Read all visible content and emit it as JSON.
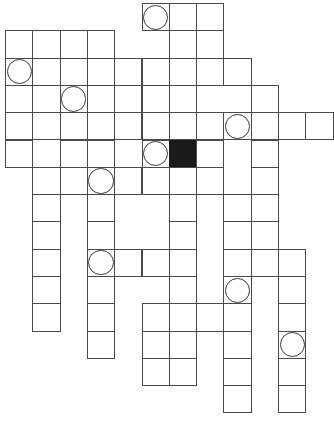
{
  "puzzle": {
    "title": "Crossword Grid",
    "type": "crossword-blank-grid",
    "columns": 12,
    "rows": 16,
    "cell_size": 27.3,
    "origin_x": 5,
    "origin_y": 3,
    "colors": {
      "background": "#ffffff",
      "cell_fill": "#ffffff",
      "cell_border": "#4a4a4a",
      "blocked_cell": "#1a1a1a",
      "circle_stroke": "#3c3c3c"
    },
    "legend": {
      "open_cell": "white square with thin grey border",
      "blocked_cell": "solid black square",
      "circled_cell": "white square containing an inscribed circle outline"
    },
    "counts": {
      "open_cells": 101,
      "blocked_cells": 1,
      "circled_cells": 9
    },
    "cells": [
      {
        "r": 0,
        "c": 5,
        "state": "circle"
      },
      {
        "r": 0,
        "c": 6,
        "state": "open"
      },
      {
        "r": 0,
        "c": 7,
        "state": "open"
      },
      {
        "r": 1,
        "c": 0,
        "state": "open"
      },
      {
        "r": 1,
        "c": 1,
        "state": "open"
      },
      {
        "r": 1,
        "c": 2,
        "state": "open"
      },
      {
        "r": 1,
        "c": 3,
        "state": "open"
      },
      {
        "r": 1,
        "c": 6,
        "state": "open"
      },
      {
        "r": 1,
        "c": 7,
        "state": "open"
      },
      {
        "r": 2,
        "c": 0,
        "state": "circle"
      },
      {
        "r": 2,
        "c": 1,
        "state": "open"
      },
      {
        "r": 2,
        "c": 3,
        "state": "open"
      },
      {
        "r": 2,
        "c": 4,
        "state": "open"
      },
      {
        "r": 2,
        "c": 5,
        "state": "open"
      },
      {
        "r": 2,
        "c": 6,
        "state": "open"
      },
      {
        "r": 2,
        "c": 7,
        "state": "open"
      },
      {
        "r": 2,
        "c": 8,
        "state": "open"
      },
      {
        "r": 3,
        "c": 0,
        "state": "open"
      },
      {
        "r": 3,
        "c": 1,
        "state": "open"
      },
      {
        "r": 3,
        "c": 2,
        "state": "circle"
      },
      {
        "r": 3,
        "c": 3,
        "state": "open"
      },
      {
        "r": 3,
        "c": 4,
        "state": "open"
      },
      {
        "r": 3,
        "c": 5,
        "state": "open"
      },
      {
        "r": 3,
        "c": 6,
        "state": "open"
      },
      {
        "r": 3,
        "c": 9,
        "state": "open"
      },
      {
        "r": 4,
        "c": 0,
        "state": "open"
      },
      {
        "r": 4,
        "c": 1,
        "state": "open"
      },
      {
        "r": 4,
        "c": 2,
        "state": "open"
      },
      {
        "r": 4,
        "c": 3,
        "state": "open"
      },
      {
        "r": 4,
        "c": 4,
        "state": "open"
      },
      {
        "r": 4,
        "c": 5,
        "state": "open"
      },
      {
        "r": 4,
        "c": 6,
        "state": "open"
      },
      {
        "r": 4,
        "c": 7,
        "state": "open"
      },
      {
        "r": 4,
        "c": 8,
        "state": "circle"
      },
      {
        "r": 4,
        "c": 9,
        "state": "open"
      },
      {
        "r": 4,
        "c": 10,
        "state": "open"
      },
      {
        "r": 4,
        "c": 11,
        "state": "open"
      },
      {
        "r": 5,
        "c": 0,
        "state": "open"
      },
      {
        "r": 5,
        "c": 2,
        "state": "open"
      },
      {
        "r": 5,
        "c": 3,
        "state": "open"
      },
      {
        "r": 5,
        "c": 5,
        "state": "circle"
      },
      {
        "r": 5,
        "c": 6,
        "state": "blocked"
      },
      {
        "r": 5,
        "c": 7,
        "state": "open"
      },
      {
        "r": 5,
        "c": 9,
        "state": "open"
      },
      {
        "r": 6,
        "c": 1,
        "state": "open"
      },
      {
        "r": 6,
        "c": 2,
        "state": "open"
      },
      {
        "r": 6,
        "c": 3,
        "state": "circle"
      },
      {
        "r": 6,
        "c": 4,
        "state": "open"
      },
      {
        "r": 6,
        "c": 5,
        "state": "open"
      },
      {
        "r": 6,
        "c": 6,
        "state": "open"
      },
      {
        "r": 6,
        "c": 7,
        "state": "open"
      },
      {
        "r": 6,
        "c": 9,
        "state": "open"
      },
      {
        "r": 7,
        "c": 1,
        "state": "open"
      },
      {
        "r": 7,
        "c": 3,
        "state": "open"
      },
      {
        "r": 7,
        "c": 6,
        "state": "open"
      },
      {
        "r": 7,
        "c": 8,
        "state": "open"
      },
      {
        "r": 7,
        "c": 9,
        "state": "open"
      },
      {
        "r": 8,
        "c": 1,
        "state": "open"
      },
      {
        "r": 8,
        "c": 3,
        "state": "open"
      },
      {
        "r": 8,
        "c": 6,
        "state": "open"
      },
      {
        "r": 8,
        "c": 8,
        "state": "open"
      },
      {
        "r": 8,
        "c": 9,
        "state": "open"
      },
      {
        "r": 9,
        "c": 1,
        "state": "open"
      },
      {
        "r": 9,
        "c": 3,
        "state": "circle"
      },
      {
        "r": 9,
        "c": 4,
        "state": "open"
      },
      {
        "r": 9,
        "c": 5,
        "state": "open"
      },
      {
        "r": 9,
        "c": 6,
        "state": "open"
      },
      {
        "r": 9,
        "c": 8,
        "state": "open"
      },
      {
        "r": 9,
        "c": 9,
        "state": "open"
      },
      {
        "r": 9,
        "c": 10,
        "state": "open"
      },
      {
        "r": 10,
        "c": 1,
        "state": "open"
      },
      {
        "r": 10,
        "c": 3,
        "state": "open"
      },
      {
        "r": 10,
        "c": 6,
        "state": "open"
      },
      {
        "r": 10,
        "c": 8,
        "state": "circle"
      },
      {
        "r": 10,
        "c": 10,
        "state": "open"
      },
      {
        "r": 11,
        "c": 1,
        "state": "open"
      },
      {
        "r": 11,
        "c": 3,
        "state": "open"
      },
      {
        "r": 11,
        "c": 5,
        "state": "open"
      },
      {
        "r": 11,
        "c": 6,
        "state": "open"
      },
      {
        "r": 11,
        "c": 7,
        "state": "open"
      },
      {
        "r": 11,
        "c": 8,
        "state": "open"
      },
      {
        "r": 11,
        "c": 10,
        "state": "open"
      },
      {
        "r": 12,
        "c": 3,
        "state": "open"
      },
      {
        "r": 12,
        "c": 5,
        "state": "open"
      },
      {
        "r": 12,
        "c": 6,
        "state": "open"
      },
      {
        "r": 12,
        "c": 8,
        "state": "open"
      },
      {
        "r": 12,
        "c": 10,
        "state": "circle"
      },
      {
        "r": 13,
        "c": 5,
        "state": "open"
      },
      {
        "r": 13,
        "c": 6,
        "state": "open"
      },
      {
        "r": 13,
        "c": 8,
        "state": "open"
      },
      {
        "r": 13,
        "c": 10,
        "state": "open"
      },
      {
        "r": 14,
        "c": 8,
        "state": "open"
      },
      {
        "r": 14,
        "c": 10,
        "state": "open"
      }
    ]
  }
}
